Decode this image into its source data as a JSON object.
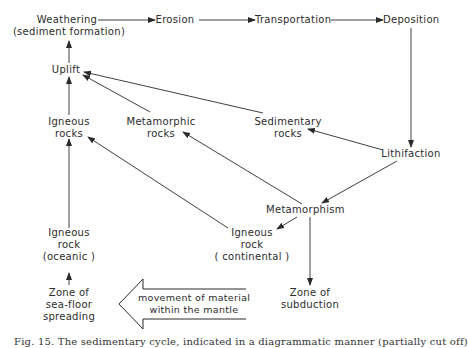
{
  "diagram": {
    "nodes": {
      "weathering": {
        "line1": "Weathering",
        "line2": "(sediment formation)"
      },
      "erosion": {
        "line1": "Erosion"
      },
      "transportation": {
        "line1": "Transportation"
      },
      "deposition": {
        "line1": "Deposition"
      },
      "uplift": {
        "line1": "Uplift"
      },
      "igneous_rocks": {
        "line1": "Igneous",
        "line2": "rocks"
      },
      "metamorphic_rocks": {
        "line1": "Metamorphic",
        "line2": "rocks"
      },
      "sedimentary_rocks": {
        "line1": "Sedimentary",
        "line2": "rocks"
      },
      "lithifaction": {
        "line1": "Lithifaction"
      },
      "metamorphism": {
        "line1": "Metamorphism"
      },
      "igneous_rock_continental": {
        "line1": "Igneous",
        "line2": "rock",
        "line3": "( continental )"
      },
      "igneous_rock_oceanic": {
        "line1": "Igneous",
        "line2": "rock",
        "line3": "(oceanic )"
      },
      "zone_seafloor": {
        "line1": "Zone of",
        "line2": "sea-floor",
        "line3": "spreading"
      },
      "zone_subduction": {
        "line1": "Zone of",
        "line2": "subduction"
      },
      "mantle_arrow": {
        "line1": "movement of material",
        "line2": "within the mantle"
      }
    },
    "edges": [
      {
        "from": "Weathering",
        "to": "Erosion"
      },
      {
        "from": "Erosion",
        "to": "Transportation"
      },
      {
        "from": "Transportation",
        "to": "Deposition"
      },
      {
        "from": "Deposition",
        "to": "Lithifaction"
      },
      {
        "from": "Lithifaction",
        "to": "Sedimentary rocks"
      },
      {
        "from": "Lithifaction",
        "to": "Metamorphism"
      },
      {
        "from": "Sedimentary rocks",
        "to": "Uplift"
      },
      {
        "from": "Metamorphic rocks",
        "to": "Uplift"
      },
      {
        "from": "Igneous rocks",
        "to": "Uplift"
      },
      {
        "from": "Uplift",
        "to": "Weathering"
      },
      {
        "from": "Metamorphism",
        "to": "Metamorphic rocks"
      },
      {
        "from": "Metamorphism",
        "to": "Igneous rock (continental)"
      },
      {
        "from": "Metamorphism",
        "to": "Zone of subduction"
      },
      {
        "from": "Igneous rock (continental)",
        "to": "Igneous rocks"
      },
      {
        "from": "Igneous rock (oceanic)",
        "to": "Igneous rocks"
      },
      {
        "from": "Zone of sea-floor spreading",
        "to": "Igneous rock (oceanic)"
      },
      {
        "from": "Zone of subduction",
        "to": "Zone of sea-floor spreading",
        "style": "hollow-arrow"
      }
    ],
    "colors": {
      "line": "#2a2a2a",
      "text": "#2c2c2c",
      "background": "#ffffff"
    }
  },
  "caption": {
    "text": "Fig. 15. The sedimentary cycle, indicated in a diagrammatic manner (partially cut off)"
  }
}
